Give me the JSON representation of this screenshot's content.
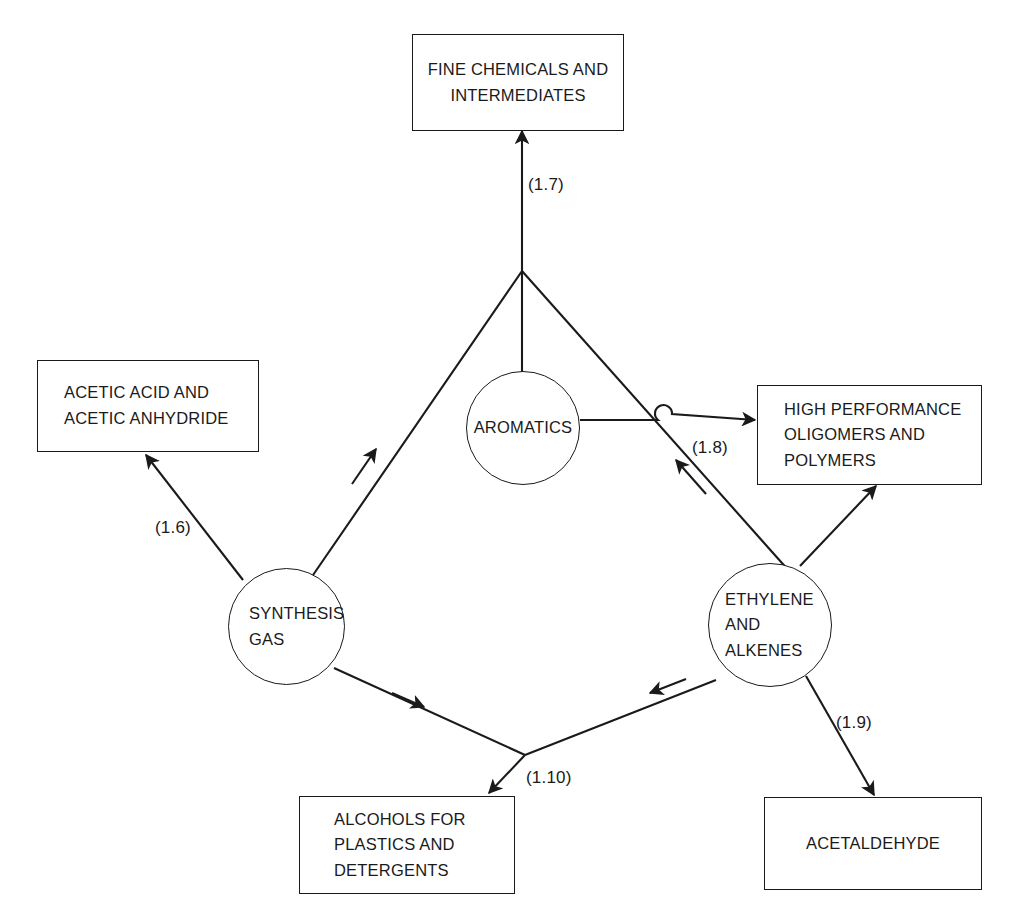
{
  "diagram": {
    "stroke_color": "#1a1a1a",
    "background_color": "#ffffff",
    "nodes": {
      "fine_chemicals": {
        "lines": [
          "FINE CHEMICALS AND",
          "INTERMEDIATES"
        ]
      },
      "acetic": {
        "lines": [
          "ACETIC ACID AND",
          "ACETIC ANHYDRIDE"
        ]
      },
      "high_performance": {
        "lines": [
          "HIGH PERFORMANCE",
          "OLIGOMERS AND",
          "POLYMERS"
        ]
      },
      "alcohols": {
        "lines": [
          "ALCOHOLS FOR",
          "PLASTICS AND",
          "DETERGENTS"
        ]
      },
      "acetaldehyde": {
        "lines": [
          "ACETALDEHYDE"
        ]
      },
      "aromatics": {
        "lines": [
          "AROMATICS"
        ]
      },
      "synthesis_gas": {
        "lines": [
          "SYNTHESIS",
          "GAS"
        ]
      },
      "ethylene": {
        "lines": [
          "ETHYLENE",
          "AND",
          "ALKENES"
        ]
      }
    },
    "edge_labels": {
      "acetic": "(1.6)",
      "fine_chemicals": "(1.7)",
      "high_performance": "(1.8)",
      "acetaldehyde": "(1.9)",
      "alcohols": "(1.10)"
    }
  }
}
